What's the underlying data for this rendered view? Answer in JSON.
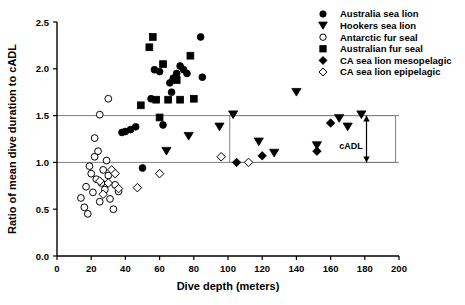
{
  "chart_data": {
    "type": "scatter",
    "title": "",
    "xlabel": "Dive depth (meters)",
    "ylabel": "Ratio of mean dive duration to cADL",
    "xlim": [
      0,
      200
    ],
    "ylim": [
      0.0,
      2.5
    ],
    "xticks": [
      0,
      20,
      40,
      60,
      80,
      100,
      120,
      140,
      160,
      180,
      200
    ],
    "xtick_labels": [
      "0",
      "20",
      "40",
      "60",
      "80",
      "100",
      "120",
      "140",
      "160",
      "180",
      "200"
    ],
    "yticks": [
      0.0,
      0.5,
      1.0,
      1.5,
      2.0,
      2.5
    ],
    "ytick_labels": [
      "0.0",
      "0.5",
      "1.0",
      "1.5",
      "2.0",
      "2.5"
    ],
    "grid": false,
    "legend_position": "top-right",
    "annotations": [
      {
        "text": "cADL",
        "x": 172,
        "y": 1.14,
        "kind": "label"
      },
      {
        "kind": "double-arrow",
        "x": 181,
        "y_from": 1.0,
        "y_to": 1.5
      },
      {
        "kind": "box",
        "x_from": 101,
        "x_to": 198,
        "y_from": 1.0,
        "y_to": 1.5
      }
    ],
    "reference_lines": [
      {
        "orientation": "horizontal",
        "value": 1.5,
        "color": "#808080"
      },
      {
        "orientation": "horizontal",
        "value": 1.0,
        "color": "#808080"
      }
    ],
    "series": [
      {
        "name": "Australia sea lion",
        "marker": "circle",
        "filled": true,
        "color": "#000000",
        "points": [
          [
            38,
            1.32
          ],
          [
            40,
            1.33
          ],
          [
            43,
            1.35
          ],
          [
            46,
            1.38
          ],
          [
            55,
            1.68
          ],
          [
            57,
            1.99
          ],
          [
            60,
            1.97
          ],
          [
            62,
            1.4
          ],
          [
            66,
            1.85
          ],
          [
            68,
            1.9
          ],
          [
            70,
            1.95
          ],
          [
            72,
            2.03
          ],
          [
            74,
            1.99
          ],
          [
            76,
            1.95
          ],
          [
            67,
            1.75
          ],
          [
            84,
            2.34
          ],
          [
            85,
            1.91
          ],
          [
            50,
            0.94
          ]
        ]
      },
      {
        "name": "Hookers sea lion",
        "marker": "triangle-down",
        "filled": true,
        "color": "#000000",
        "points": [
          [
            64,
            1.12
          ],
          [
            77,
            1.28
          ],
          [
            95,
            1.38
          ],
          [
            103,
            1.51
          ],
          [
            118,
            1.22
          ],
          [
            127,
            1.1
          ],
          [
            140,
            1.75
          ],
          [
            152,
            1.18
          ],
          [
            165,
            1.47
          ],
          [
            178,
            1.51
          ],
          [
            170,
            1.38
          ]
        ]
      },
      {
        "name": "Antarctic fur seal",
        "marker": "circle",
        "filled": false,
        "color": "#000000",
        "points": [
          [
            14,
            0.62
          ],
          [
            16,
            0.52
          ],
          [
            17,
            0.74
          ],
          [
            18,
            0.45
          ],
          [
            19,
            0.96
          ],
          [
            20,
            0.88
          ],
          [
            21,
            0.68
          ],
          [
            22,
            1.06
          ],
          [
            23,
            0.82
          ],
          [
            24,
            1.12
          ],
          [
            25,
            0.58
          ],
          [
            26,
            0.78
          ],
          [
            27,
            0.92
          ],
          [
            28,
            0.71
          ],
          [
            29,
            1.02
          ],
          [
            30,
            0.86
          ],
          [
            31,
            0.61
          ],
          [
            33,
            0.5
          ],
          [
            34,
            0.76
          ],
          [
            36,
            0.69
          ],
          [
            25,
            1.51
          ],
          [
            30,
            1.68
          ],
          [
            22,
            1.26
          ]
        ]
      },
      {
        "name": "Australian fur seal",
        "marker": "square",
        "filled": true,
        "color": "#000000",
        "points": [
          [
            54,
            2.23
          ],
          [
            56,
            2.34
          ],
          [
            62,
            2.05
          ],
          [
            65,
            1.67
          ],
          [
            58,
            1.67
          ],
          [
            70,
            1.88
          ],
          [
            72,
            1.67
          ],
          [
            78,
            2.14
          ],
          [
            80,
            1.68
          ],
          [
            60,
            1.48
          ],
          [
            49,
            1.61
          ]
        ]
      },
      {
        "name": "CA sea lion mesopelagic",
        "marker": "diamond",
        "filled": true,
        "color": "#000000",
        "points": [
          [
            105,
            1.0
          ],
          [
            120,
            1.07
          ],
          [
            152,
            1.12
          ],
          [
            160,
            1.42
          ]
        ]
      },
      {
        "name": "CA sea lion epipelagic",
        "marker": "diamond",
        "filled": false,
        "color": "#000000",
        "points": [
          [
            32,
            0.92
          ],
          [
            34,
            0.88
          ],
          [
            30,
            0.78
          ],
          [
            27,
            0.66
          ],
          [
            36,
            0.72
          ],
          [
            25,
            0.8
          ],
          [
            47,
            0.73
          ],
          [
            60,
            0.88
          ],
          [
            96,
            1.06
          ],
          [
            112,
            1.0
          ]
        ]
      }
    ]
  },
  "legend": {
    "items": [
      {
        "label": "Australia sea lion",
        "marker": "circle-filled"
      },
      {
        "label": "Hookers sea lion",
        "marker": "triangle-down-filled"
      },
      {
        "label": "Antarctic fur seal",
        "marker": "circle-open"
      },
      {
        "label": "Australian fur seal",
        "marker": "square-filled"
      },
      {
        "label": "CA sea lion mesopelagic",
        "marker": "diamond-filled"
      },
      {
        "label": "CA sea lion epipelagic",
        "marker": "diamond-open"
      }
    ]
  }
}
